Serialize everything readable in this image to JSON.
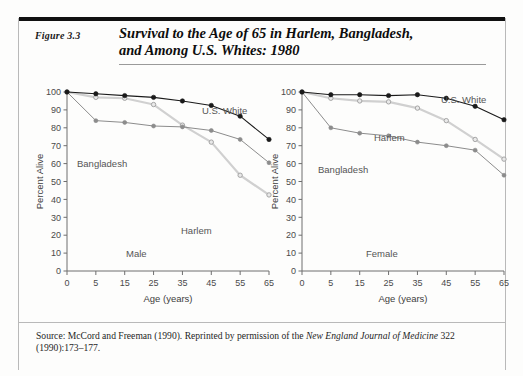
{
  "figure": {
    "number": "Figure 3.3",
    "title_line1": "Survival to the Age of 65 in Harlem, Bangladesh,",
    "title_line2": "and Among U.S. Whites: 1980",
    "source_prefix": "Source: McCord and Freeman (1990). Reprinted by permission of the ",
    "source_journal": "New England Journal of Medicine",
    "source_suffix": " 322 (1990):173–177."
  },
  "colors": {
    "us_white": "#1a1a1a",
    "bangladesh": "#8c8c8c",
    "harlem": "#d0d0d0",
    "axis": "#6e6e6e",
    "text": "#4a4a4a",
    "rule_dark": "#111111",
    "rule_light": "#9a9a9a"
  },
  "chart_data": [
    {
      "type": "line",
      "title": "Male",
      "panel": "Male",
      "xlabel": "Age (years)",
      "ylabel": "Percent Alive",
      "x": [
        0,
        5,
        15,
        25,
        35,
        45,
        55,
        65
      ],
      "xtick_labels": [
        "0",
        "5",
        "15",
        "25",
        "35",
        "45",
        "55",
        "65"
      ],
      "ytick_labels": [
        "0",
        "10",
        "20",
        "30",
        "40",
        "50",
        "60",
        "70",
        "80",
        "90",
        "100"
      ],
      "ylim": [
        0,
        100
      ],
      "grid": false,
      "legend": "inline-labels",
      "series": [
        {
          "name": "U.S. White",
          "values": [
            100,
            99,
            98,
            97,
            95,
            92.5,
            86.5,
            73.5
          ]
        },
        {
          "name": "Harlem",
          "values": [
            100,
            97,
            96.5,
            93,
            81.5,
            72,
            53.5,
            42.5
          ]
        },
        {
          "name": "Bangladesh",
          "values": [
            100,
            84,
            83,
            81,
            80.5,
            78.5,
            73.5,
            60.5
          ]
        }
      ]
    },
    {
      "type": "line",
      "title": "Female",
      "panel": "Female",
      "xlabel": "Age (years)",
      "ylabel": "Percent Alive",
      "x": [
        0,
        5,
        15,
        25,
        35,
        45,
        55,
        65
      ],
      "xtick_labels": [
        "0",
        "5",
        "15",
        "25",
        "35",
        "45",
        "55",
        "65"
      ],
      "ytick_labels": [
        "0",
        "10",
        "20",
        "30",
        "40",
        "50",
        "60",
        "70",
        "80",
        "90",
        "100"
      ],
      "ylim": [
        0,
        100
      ],
      "grid": false,
      "legend": "inline-labels",
      "series": [
        {
          "name": "U.S. White",
          "values": [
            100,
            98.5,
            98.5,
            98,
            98.5,
            96.5,
            92,
            84.5
          ]
        },
        {
          "name": "Harlem",
          "values": [
            100,
            96.5,
            95,
            94.5,
            91,
            84,
            73.5,
            62.5
          ]
        },
        {
          "name": "Bangladesh",
          "values": [
            100,
            80,
            77,
            75.5,
            72,
            70,
            67.5,
            53.5
          ]
        }
      ]
    }
  ],
  "annotations": {
    "male": {
      "us_white": "U.S. White",
      "harlem": "Harlem",
      "bangladesh": "Bangladesh",
      "panel": "Male"
    },
    "female": {
      "us_white": "U.S. White",
      "harlem": "Harlem",
      "bangladesh": "Bangladesh",
      "panel": "Female"
    }
  }
}
